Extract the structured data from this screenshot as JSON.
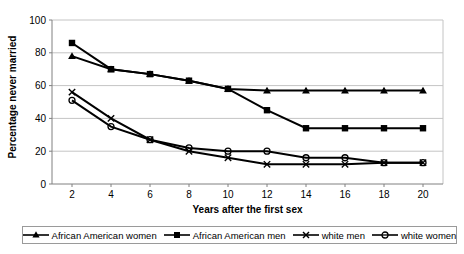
{
  "chart_data": {
    "type": "line",
    "x": [
      2,
      4,
      6,
      8,
      10,
      12,
      14,
      16,
      18,
      20
    ],
    "x_tick_labels": [
      "2",
      "4",
      "6",
      "8",
      "10",
      "12",
      "14",
      "16",
      "18",
      "20"
    ],
    "y_ticks": [
      0,
      20,
      40,
      60,
      80,
      100
    ],
    "ylim": [
      0,
      100
    ],
    "xlabel": "Years after the first sex",
    "ylabel": "Percentage never married",
    "grid": "horizontal",
    "legend_position": "bottom",
    "colors": {
      "series_line": "#000000",
      "gridline": "#c4c4c4",
      "axis_line": "#808080",
      "tick_text": "#000000",
      "legend_border": "#9a9a9a"
    },
    "series": [
      {
        "name": "African American women",
        "marker": "triangle",
        "values": [
          78,
          70,
          67,
          63,
          58,
          57,
          57,
          57,
          57,
          57
        ]
      },
      {
        "name": "African American men",
        "marker": "square",
        "values": [
          86,
          70,
          67,
          63,
          58,
          45,
          34,
          34,
          34,
          34
        ]
      },
      {
        "name": "white men",
        "marker": "x",
        "values": [
          56,
          40,
          27,
          20,
          16,
          12,
          12,
          12,
          13,
          13
        ]
      },
      {
        "name": "white women",
        "marker": "circle",
        "values": [
          51,
          35,
          27,
          22,
          20,
          20,
          16,
          16,
          13,
          13
        ]
      }
    ]
  }
}
